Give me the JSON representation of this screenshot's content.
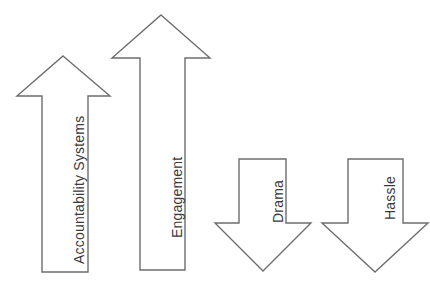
{
  "diagram": {
    "background_color": "#ffffff",
    "outline_color": "#6d6d6d",
    "fill_color": "#ffffff",
    "label_color": "#3a3a3a",
    "arrows": [
      {
        "id": "accountability-systems",
        "label": "Accountability Systems",
        "direction": "up",
        "label_rotation_deg": -90,
        "geometry": {
          "tip_x": 63,
          "tip_y": 56,
          "head_base_y": 96,
          "head_left_x": 17,
          "head_right_x": 110,
          "shaft_left_x": 42,
          "shaft_right_x": 88,
          "base_y": 272
        },
        "label_pos": {
          "x": 72,
          "y": 264
        }
      },
      {
        "id": "engagement",
        "label": "Engagement",
        "direction": "up",
        "label_rotation_deg": -90,
        "geometry": {
          "tip_x": 161,
          "tip_y": 15,
          "head_base_y": 58,
          "head_left_x": 112,
          "head_right_x": 210,
          "shaft_left_x": 140,
          "shaft_right_x": 185,
          "base_y": 270
        },
        "label_pos": {
          "x": 170,
          "y": 238
        }
      },
      {
        "id": "drama",
        "label": "Drama",
        "direction": "down",
        "label_rotation_deg": -90,
        "geometry": {
          "tip_x": 263,
          "tip_y": 271,
          "head_base_y": 223,
          "head_left_x": 215,
          "head_right_x": 311,
          "shaft_left_x": 239,
          "shaft_right_x": 286,
          "base_y": 159
        },
        "label_pos": {
          "x": 271,
          "y": 223
        }
      },
      {
        "id": "hassle",
        "label": "Hassle",
        "direction": "down",
        "label_rotation_deg": -90,
        "geometry": {
          "tip_x": 375,
          "tip_y": 272,
          "head_base_y": 223,
          "head_left_x": 322,
          "head_right_x": 428,
          "shaft_left_x": 348,
          "shaft_right_x": 403,
          "base_y": 159
        },
        "label_pos": {
          "x": 383,
          "y": 220
        }
      }
    ]
  }
}
